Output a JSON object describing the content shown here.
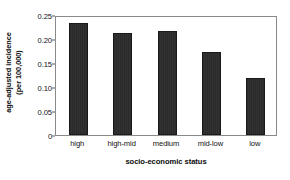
{
  "chart_data": {
    "type": "bar",
    "title": "",
    "subtitle": "",
    "xlabel": "socio-economic status",
    "ylabel": "age-adjusted incidence\n(per 100,000)",
    "ylabel_line1": "age-adjusted incidence",
    "ylabel_line2": "(per 100,000)",
    "categories": [
      "high",
      "high-mid",
      "medium",
      "mid-low",
      "low"
    ],
    "values": [
      0.234,
      0.213,
      0.216,
      0.172,
      0.119
    ],
    "ylim": [
      0,
      0.25
    ],
    "yticks": [
      0,
      0.05,
      0.1,
      0.15,
      0.2,
      0.25
    ],
    "ytick_labels": [
      "0",
      "0.05",
      "0.10",
      "0.15",
      "0.20",
      "0.25"
    ],
    "grid": false,
    "legend": null,
    "legend_position": "none",
    "bar_color": "#2e2e2e",
    "bar_edge_color": "#1a1a1a",
    "frame_color": "#8a8a8a",
    "background_color": "#ffffff",
    "text_color": "#111111"
  }
}
